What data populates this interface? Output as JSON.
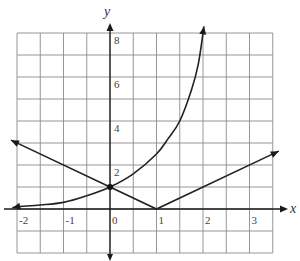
{
  "chart_data": {
    "type": "line",
    "title": "",
    "xlabel": "x",
    "ylabel": "y",
    "xlim": [
      -2,
      3.5
    ],
    "ylim": [
      -2,
      8
    ],
    "grid": true,
    "grid_step_x": 0.5,
    "grid_step_y": 1,
    "x_tick_labels": [
      "-2",
      "-1",
      "0",
      "1",
      "2",
      "3"
    ],
    "x_tick_values": [
      -2,
      -1,
      0,
      1,
      2,
      3
    ],
    "y_tick_labels": [
      "2",
      "4",
      "6",
      "8"
    ],
    "y_tick_values": [
      2,
      4,
      6,
      8
    ],
    "legend": null,
    "series": [
      {
        "name": "exponential curve",
        "description": "increasing exponential through (0,1), arrows at both ends",
        "x": [
          -2.1,
          -2,
          -1.5,
          -1,
          -0.5,
          0,
          0.5,
          1,
          1.25,
          1.5,
          1.75,
          1.9,
          2.02
        ],
        "y": [
          0.05,
          0.1,
          0.18,
          0.3,
          0.6,
          1,
          1.6,
          2.5,
          3.2,
          4.0,
          5.4,
          6.6,
          8.3
        ]
      },
      {
        "name": "absolute value line",
        "description": "V-shaped graph y = |x - 1| with vertex at (1,0), arrows at both ends",
        "x": [
          -2.13,
          0,
          1,
          3.63
        ],
        "y": [
          3.13,
          1,
          0,
          2.63
        ]
      }
    ],
    "points": [
      {
        "label": "intersection",
        "x": 0,
        "y": 1
      }
    ],
    "annotations": []
  }
}
